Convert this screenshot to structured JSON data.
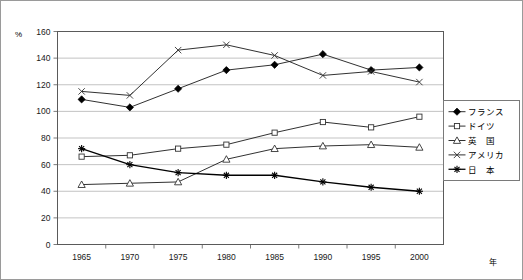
{
  "chart_data": {
    "type": "line",
    "title": "",
    "xlabel": "年",
    "ylabel": "%",
    "x": [
      1965,
      1970,
      1975,
      1980,
      1985,
      1990,
      1995,
      2000
    ],
    "categories": [
      "1965",
      "1970",
      "1975",
      "1980",
      "1985",
      "1990",
      "1995",
      "2000"
    ],
    "ylim": [
      0,
      160
    ],
    "yticks": [
      0,
      20,
      40,
      60,
      80,
      100,
      120,
      140,
      160
    ],
    "ytick_labels": [
      "0",
      "20",
      "40",
      "60",
      "80",
      "100",
      "120",
      "140",
      "160"
    ],
    "grid": true,
    "legend_position": "right",
    "series": [
      {
        "name": "フランス",
        "marker": "filled-diamond",
        "values": [
          109,
          103,
          117,
          131,
          135,
          143,
          131,
          133
        ]
      },
      {
        "name": "ドイツ",
        "marker": "hollow-square",
        "values": [
          66,
          67,
          72,
          75,
          84,
          92,
          88,
          96
        ]
      },
      {
        "name": "英　国",
        "marker": "hollow-triangle",
        "values": [
          45,
          46,
          47,
          64,
          72,
          74,
          75,
          73
        ]
      },
      {
        "name": "アメリカ",
        "marker": "cross",
        "values": [
          115,
          112,
          146,
          150,
          142,
          127,
          130,
          122
        ]
      },
      {
        "name": "日　本",
        "marker": "star",
        "values": [
          72,
          60,
          54,
          52,
          52,
          47,
          43,
          40
        ]
      }
    ]
  },
  "axes": {
    "y_unit": "%",
    "x_unit": "年"
  },
  "legend": {
    "items": [
      {
        "label": "フランス"
      },
      {
        "label": "ドイツ"
      },
      {
        "label": "英　国"
      },
      {
        "label": "アメリカ"
      },
      {
        "label": "日　本"
      }
    ]
  }
}
